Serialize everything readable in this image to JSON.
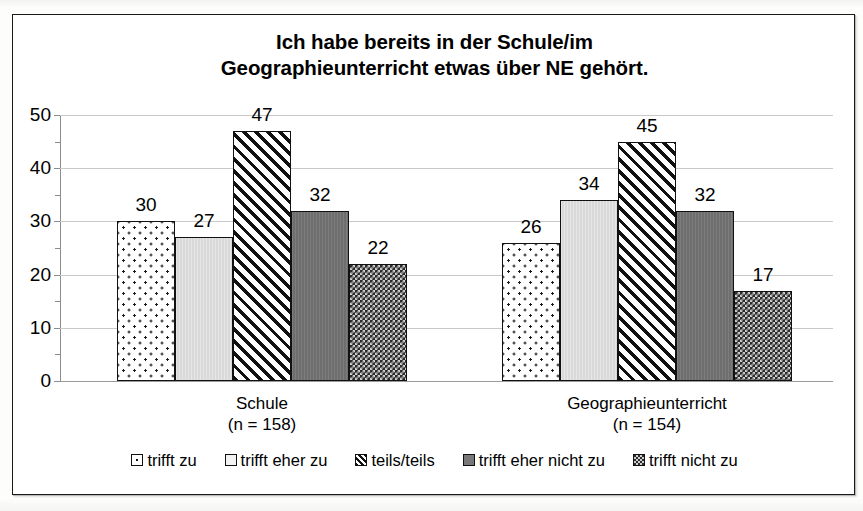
{
  "chart_data": {
    "type": "bar",
    "title": "Ich habe bereits in der Schule/im Geographieunterricht etwas über NE gehört.",
    "title_lines": [
      "Ich habe bereits in der Schule/im",
      "Geographieunterricht etwas über NE gehört."
    ],
    "xlabel": "",
    "ylabel": "",
    "ylim": [
      0,
      50
    ],
    "ytick_labels": [
      "0",
      "10",
      "20",
      "30",
      "40",
      "50"
    ],
    "ytick_values": [
      0,
      10,
      20,
      30,
      40,
      50
    ],
    "minor_tick_values": [
      5,
      15,
      25,
      35,
      45
    ],
    "grid": true,
    "grid_orientation": "horizontal",
    "legend_position": "bottom",
    "categories": [
      "Schule",
      "Geographieunterricht"
    ],
    "category_labels": [
      {
        "name": "Schule",
        "n": "(n = 158)"
      },
      {
        "name": "Geographieunterricht",
        "n": "(n = 154)"
      }
    ],
    "series": [
      {
        "name": "trifft zu",
        "pattern": "dots",
        "values": [
          30,
          26
        ]
      },
      {
        "name": "trifft eher zu",
        "pattern": "lightgrey",
        "values": [
          27,
          34
        ]
      },
      {
        "name": "teils/teils",
        "pattern": "hatch",
        "values": [
          47,
          45
        ]
      },
      {
        "name": "trifft eher nicht zu",
        "pattern": "darkgrey",
        "values": [
          32,
          32
        ]
      },
      {
        "name": "trifft nicht zu",
        "pattern": "check",
        "values": [
          22,
          17
        ]
      }
    ],
    "data_labels": {
      "Schule": [
        "30",
        "27",
        "47",
        "32",
        "22"
      ],
      "Geographieunterricht": [
        "26",
        "34",
        "45",
        "32",
        "17"
      ]
    },
    "colors": {
      "bar_outline": "#111111",
      "gridline": "#c9c9c9",
      "axis": "#8c8c8c",
      "text": "#000000",
      "background": "#ffffff"
    }
  },
  "legend": {
    "items": [
      {
        "label": "trifft zu"
      },
      {
        "label": "trifft eher zu"
      },
      {
        "label": "teils/teils"
      },
      {
        "label": "trifft eher nicht zu"
      },
      {
        "label": "trifft nicht zu"
      }
    ]
  }
}
